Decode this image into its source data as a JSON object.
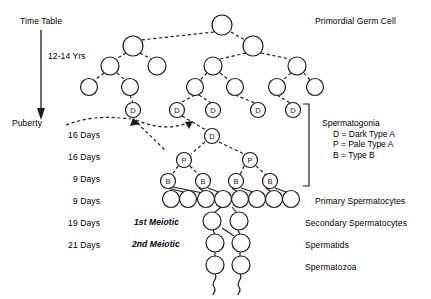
{
  "diagram": {
    "title_left": "Time Table",
    "title_right": "Primordial Germ Cell",
    "timeline": {
      "top_label": "Time Table",
      "duration_label": "12-14 Yrs",
      "puberty_label": "Puberty",
      "stages": [
        "16 Days",
        "16 Days",
        "9 Days",
        "9 Days",
        "19 Days",
        "21 Days"
      ]
    },
    "phase_labels": {
      "first_meiotic": "1st Meiotic",
      "second_meiotic": "2nd Meiotic"
    },
    "right_labels": {
      "primordial": "Primordial Germ Cell",
      "spermatogonia": "Spermatogonia",
      "legend_d": "D = Dark Type A",
      "legend_p": "P = Pale Type A",
      "legend_b": "B = Type B",
      "primary_spermatocytes": "Primary Spermatocytes",
      "secondary_spermatocytes": "Secondary Spermatocytes",
      "spermatids": "Spermatids",
      "spermatozoa": "Spermatozoa"
    },
    "cell_marks": {
      "dark_type_a": "D",
      "pale_type_a": "P",
      "type_b": "B"
    },
    "colors": {
      "stroke": "#1a1a1a",
      "background": "#ffffff"
    },
    "nodes": {
      "row1": [
        {
          "x": 222,
          "y": 25,
          "r": 10
        }
      ],
      "row2": [
        {
          "x": 133,
          "y": 46,
          "r": 10
        },
        {
          "x": 253,
          "y": 46,
          "r": 10
        }
      ],
      "row3": [
        {
          "x": 110,
          "y": 66,
          "r": 9
        },
        {
          "x": 157,
          "y": 66,
          "r": 9
        },
        {
          "x": 213,
          "y": 66,
          "r": 9
        },
        {
          "x": 297,
          "y": 66,
          "r": 9
        }
      ],
      "row4": [
        {
          "x": 89,
          "y": 87,
          "r": 8
        },
        {
          "x": 130,
          "y": 87,
          "r": 8
        },
        {
          "x": 195,
          "y": 87,
          "r": 8
        },
        {
          "x": 235,
          "y": 87,
          "r": 8
        },
        {
          "x": 277,
          "y": 87,
          "r": 8
        },
        {
          "x": 315,
          "y": 87,
          "r": 8
        }
      ],
      "row_d": [
        {
          "x": 133,
          "y": 110,
          "r": 7.5,
          "mark": "D"
        },
        {
          "x": 177,
          "y": 110,
          "r": 7.5,
          "mark": "D"
        },
        {
          "x": 213,
          "y": 110,
          "r": 7.5,
          "mark": "D"
        },
        {
          "x": 258,
          "y": 110,
          "r": 7.5,
          "mark": "D"
        },
        {
          "x": 293,
          "y": 110,
          "r": 7.5,
          "mark": "D"
        }
      ],
      "row_d2": [
        {
          "x": 212,
          "y": 136,
          "r": 7.5,
          "mark": "D"
        }
      ],
      "row_p": [
        {
          "x": 184,
          "y": 160,
          "r": 7.5,
          "mark": "P"
        },
        {
          "x": 250,
          "y": 160,
          "r": 7.5,
          "mark": "P"
        }
      ],
      "row_b": [
        {
          "x": 168,
          "y": 181,
          "r": 7.5,
          "mark": "B"
        },
        {
          "x": 203,
          "y": 181,
          "r": 7.5,
          "mark": "B"
        },
        {
          "x": 236,
          "y": 181,
          "r": 7.5,
          "mark": "B"
        },
        {
          "x": 270,
          "y": 181,
          "r": 7.5,
          "mark": "B"
        }
      ],
      "row_primary": [
        {
          "x": 186,
          "y": 199,
          "r": 8.5
        },
        {
          "x": 204,
          "y": 199,
          "r": 8.5
        },
        {
          "x": 221,
          "y": 199,
          "r": 8.5
        },
        {
          "x": 238,
          "y": 199,
          "r": 8.5
        },
        {
          "x": 255,
          "y": 199,
          "r": 8.5
        },
        {
          "x": 272,
          "y": 199,
          "r": 8.5
        },
        {
          "x": 289,
          "y": 199,
          "r": 8.5
        }
      ],
      "row_secondary": [
        {
          "x": 212,
          "y": 221,
          "r": 9
        },
        {
          "x": 238,
          "y": 221,
          "r": 9
        }
      ],
      "row_spermatids": [
        {
          "x": 215,
          "y": 243,
          "r": 9
        },
        {
          "x": 240,
          "y": 243,
          "r": 9
        }
      ],
      "row_spermatozoa": [
        {
          "x": 215,
          "y": 265,
          "r": 9
        },
        {
          "x": 240,
          "y": 265,
          "r": 9
        }
      ]
    }
  }
}
